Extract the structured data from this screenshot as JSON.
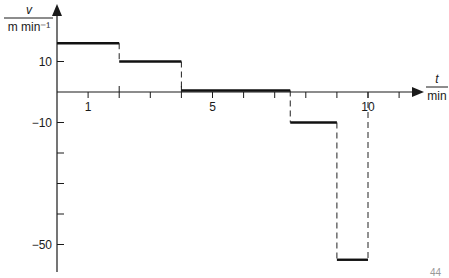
{
  "chart_data": {
    "type": "line",
    "subtype": "step",
    "title": "",
    "xlabel": "t / min",
    "ylabel": "v / m min⁻¹",
    "x_label_numerator": "t",
    "x_label_denominator": "min",
    "y_label_numerator": "v",
    "y_label_denominator": "m min⁻¹",
    "xlim": [
      0,
      11.5
    ],
    "ylim": [
      -58,
      28
    ],
    "x_tick_labels": [
      {
        "value": 1,
        "label": "1"
      },
      {
        "value": 5,
        "label": "5"
      },
      {
        "value": 10,
        "label": "10"
      }
    ],
    "x_ticks": [
      1,
      2,
      3,
      4,
      5,
      6,
      7,
      8,
      9,
      10,
      11
    ],
    "y_tick_labels": [
      {
        "value": 10,
        "label": "10"
      },
      {
        "value": -10,
        "label": "−10"
      },
      {
        "value": -50,
        "label": "−50"
      }
    ],
    "y_ticks": [
      10,
      -10,
      -20,
      -30,
      -40,
      -50
    ],
    "grid": false,
    "segments": [
      {
        "t_start": 0,
        "t_end": 2,
        "v": 16
      },
      {
        "t_start": 2,
        "t_end": 4,
        "v": 10
      },
      {
        "t_start": 4,
        "t_end": 7.5,
        "v": 0.5
      },
      {
        "t_start": 7.5,
        "t_end": 9,
        "v": -10
      },
      {
        "t_start": 9,
        "t_end": 10,
        "v": -55
      }
    ],
    "dashed_connectors_at_t": [
      2,
      4,
      7.5,
      9,
      10
    ]
  },
  "page_fragment": "44"
}
